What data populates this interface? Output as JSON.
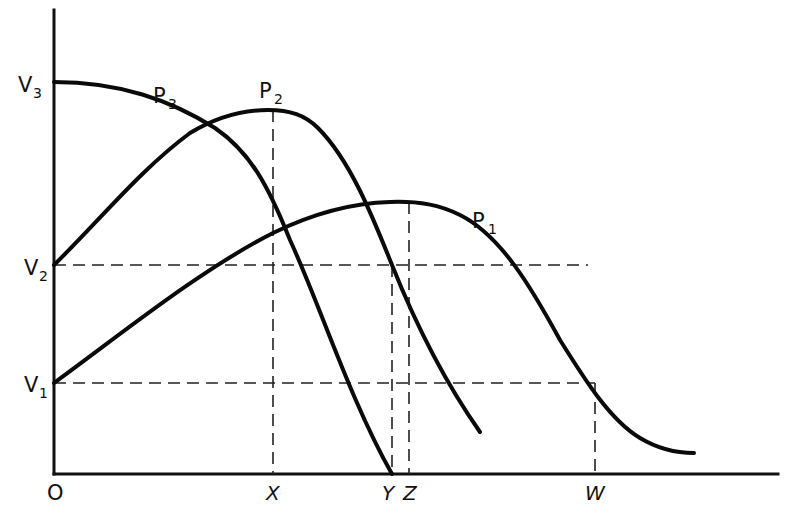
{
  "diagram": {
    "origin_label": "O",
    "y_axis": {
      "ticks": [
        {
          "id": "V3",
          "base": "V",
          "sub": "3",
          "y": 82
        },
        {
          "id": "V2",
          "base": "V",
          "sub": "2",
          "y": 265
        },
        {
          "id": "V1",
          "base": "V",
          "sub": "1",
          "y": 383
        }
      ]
    },
    "x_axis": {
      "ticks": [
        {
          "id": "X",
          "label": "X",
          "x": 273
        },
        {
          "id": "Y",
          "label": "Y",
          "x": 392
        },
        {
          "id": "Z",
          "label": "Z",
          "x": 409
        },
        {
          "id": "W",
          "label": "W",
          "x": 595
        }
      ]
    },
    "curves": [
      {
        "id": "P1",
        "base": "P",
        "sub": "1",
        "description": "starts at V1, peaks above Z, crosses V1 level at W"
      },
      {
        "id": "P2",
        "base": "P",
        "sub": "2",
        "description": "starts at V2, peaks above X, crosses V2 level near Z"
      },
      {
        "id": "P3",
        "base": "P",
        "sub": "3",
        "description": "starts at V3, decreasing, reaches zero at Y"
      }
    ],
    "colors": {
      "line": "#0a0a0a",
      "background": "#ffffff"
    }
  }
}
